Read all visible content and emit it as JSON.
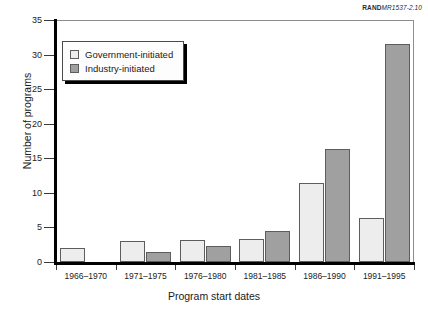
{
  "credit": {
    "brand": "RAND",
    "document": "MR1537-2.10"
  },
  "chart_data": {
    "type": "bar",
    "title": "",
    "xlabel": "Program start dates",
    "ylabel": "Number of programs",
    "categories": [
      "1966–1970",
      "1971–1975",
      "1976–1980",
      "1981–1985",
      "1986–1990",
      "1991–1995"
    ],
    "series": [
      {
        "name": "Government-initiated",
        "color": "#ededed",
        "values": [
          2.0,
          3.1,
          3.2,
          3.4,
          11.4,
          6.4
        ]
      },
      {
        "name": "Industry-initiated",
        "color": "#a0a0a0",
        "values": [
          0.0,
          1.4,
          2.3,
          4.5,
          16.4,
          31.6
        ]
      }
    ],
    "ylim": [
      0,
      35
    ],
    "yticks": [
      0,
      5,
      10,
      15,
      20,
      25,
      30,
      35
    ],
    "ytick_labels": [
      "0",
      "5",
      "10",
      "15",
      "20",
      "25",
      "30",
      "35"
    ],
    "grid": false,
    "legend_position": "upper-left"
  }
}
